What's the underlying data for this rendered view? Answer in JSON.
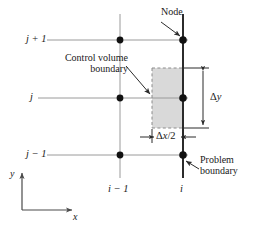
{
  "figure": {
    "colors": {
      "grid_line": "#9a9a9a",
      "boundary_line": "#2b2b2b",
      "node_fill": "#111111",
      "cv_fill": "#d9d9d9",
      "cv_dash": "#8c8c8c",
      "text": "#1a1a1a",
      "dimension_line": "#2b2b2b"
    }
  },
  "row_labels": [
    {
      "id": "j-plus-1",
      "text": "j + 1",
      "y": 40
    },
    {
      "id": "j",
      "text": "j",
      "y": 98
    },
    {
      "id": "j-minus-1",
      "text": "j − 1",
      "y": 155
    }
  ],
  "column_labels": [
    {
      "id": "i-minus-1",
      "text": "i − 1",
      "x": 120
    },
    {
      "id": "i",
      "text": "i",
      "x": 183
    }
  ],
  "annotations": {
    "node": {
      "text": "Node"
    },
    "control_volume": {
      "line1": "Control volume",
      "line2": "boundary"
    },
    "problem_boundary": {
      "line1": "Problem",
      "line2": "boundary"
    }
  },
  "dimensions": {
    "delta_y": {
      "symbol": "Δ",
      "variable": "y"
    },
    "delta_x_half": {
      "symbol": "Δ",
      "variable": "x",
      "divisor": "/2"
    }
  },
  "axes": {
    "x_label": "x",
    "y_label": "y"
  }
}
